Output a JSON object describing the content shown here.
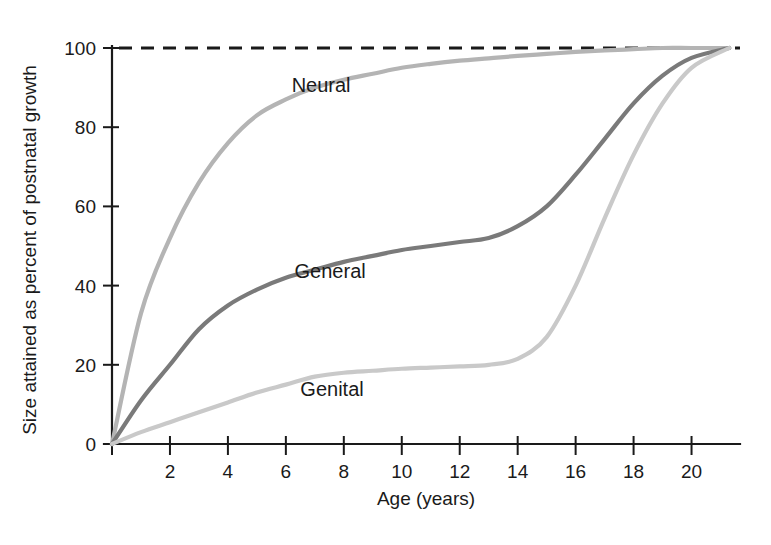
{
  "chart_data": {
    "type": "line",
    "title": "",
    "xlabel": "Age (years)",
    "ylabel": "Size attained as percent of postnatal growth",
    "xlim": [
      0,
      21.5
    ],
    "ylim": [
      0,
      104
    ],
    "xticks": [
      0,
      2,
      4,
      6,
      8,
      10,
      12,
      14,
      16,
      18,
      20
    ],
    "xtick_labels": [
      "",
      "2",
      "4",
      "6",
      "8",
      "10",
      "12",
      "14",
      "16",
      "18",
      "20"
    ],
    "yticks": [
      0,
      20,
      40,
      60,
      80,
      100
    ],
    "ytick_labels": [
      "0",
      "20",
      "40",
      "60",
      "80",
      "100"
    ],
    "grid": false,
    "legend_position": "inline-annotations",
    "annotations": [
      {
        "text": "Neural",
        "x": 6.2,
        "y": 89
      },
      {
        "text": "General",
        "x": 6.3,
        "y": 42
      },
      {
        "text": "Genital",
        "x": 6.5,
        "y": 12
      }
    ],
    "reference_lines": [
      {
        "y": 100,
        "style": "dashed",
        "color": "#1a1a1a",
        "label": "100% adult size"
      }
    ],
    "x": [
      0,
      1,
      2,
      3,
      4,
      5,
      6,
      7,
      8,
      9,
      10,
      11,
      12,
      13,
      14,
      15,
      16,
      17,
      18,
      19,
      20,
      21.3
    ],
    "series": [
      {
        "name": "Neural",
        "color": "#b4b4b4",
        "values": [
          0,
          33,
          52,
          66,
          76,
          83,
          87,
          90,
          92,
          93.5,
          95,
          96,
          96.8,
          97.4,
          98,
          98.5,
          99,
          99.4,
          99.7,
          100,
          100,
          100
        ]
      },
      {
        "name": "General",
        "color": "#7a7a7a",
        "values": [
          0,
          11,
          20,
          29,
          35,
          39,
          42,
          44,
          46,
          47.5,
          49,
          50,
          51,
          52,
          55,
          60,
          68,
          77,
          86,
          93,
          97.5,
          100
        ]
      },
      {
        "name": "Genital",
        "color": "#c9c9c9",
        "values": [
          0,
          3,
          5.5,
          8,
          10.5,
          13,
          15,
          17,
          18,
          18.5,
          19,
          19.3,
          19.6,
          20,
          21.5,
          27,
          40,
          57,
          73,
          86,
          95,
          100
        ]
      }
    ]
  },
  "axis": {
    "x_title": "Age (years)",
    "y_title": "Size attained as percent of postnatal growth"
  }
}
